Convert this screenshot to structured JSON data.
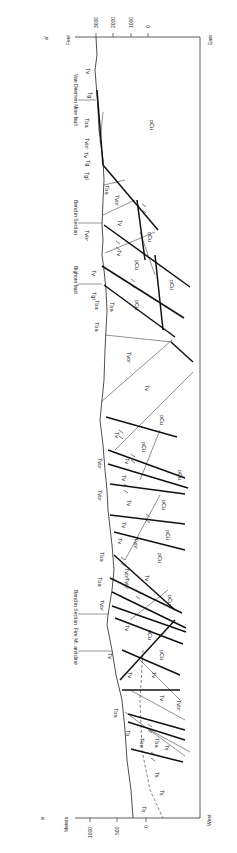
{
  "section": {
    "start_label": "a",
    "end_label": "a'",
    "west_label": "West",
    "east_label": "East"
  },
  "left_axis": {
    "unit": "Meters",
    "ticks": [
      "1000",
      "500",
      "0"
    ]
  },
  "right_axis": {
    "unit": "Feet",
    "ticks": [
      "3000",
      "2000",
      "1000",
      "0"
    ]
  },
  "features": [
    {
      "id": "van-deemen-mine-fault",
      "label": "Van Deemen Mine fault"
    },
    {
      "id": "bend-in-section-east",
      "label": "Bend in Section"
    },
    {
      "id": "bighorn-fault",
      "label": "Bighorn fault"
    },
    {
      "id": "bend-in-section-west",
      "label": "Bend in Section"
    },
    {
      "id": "fire-mt-anticline",
      "label": "Fire Mt. anticline"
    }
  ],
  "units": {
    "tv": "Tv",
    "tg": "Tg",
    "tba": "Tba",
    "tvbr": "Tvbr",
    "tgl": "Tgl",
    "pcu": "pCu",
    "ts": "Ts",
    "tb": "Tb"
  }
}
